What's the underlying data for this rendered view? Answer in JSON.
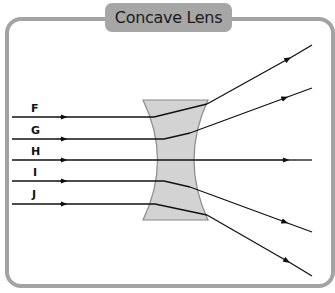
{
  "title": "Concave Lens",
  "colors": {
    "frame": "#a3a3a3",
    "title_tab": "#a6a6a6",
    "lens_fill": "#d3d3d3",
    "lens_stroke": "#8a8a8a",
    "ray": "#111111"
  },
  "rays": [
    {
      "label": "F",
      "y": 117
    },
    {
      "label": "G",
      "y": 139
    },
    {
      "label": "H",
      "y": 160
    },
    {
      "label": "I",
      "y": 181
    },
    {
      "label": "J",
      "y": 204
    }
  ]
}
